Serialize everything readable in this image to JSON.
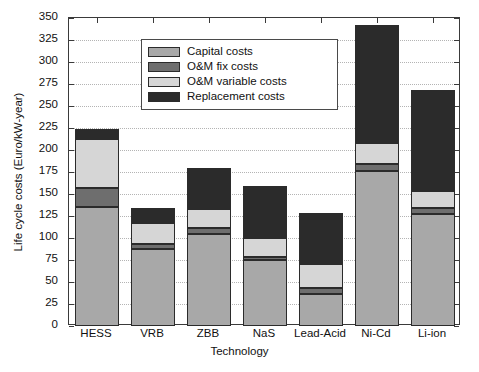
{
  "chart_data": {
    "type": "bar",
    "stacked": true,
    "title": "",
    "xlabel": "Technology",
    "ylabel": "Life cycle costs (Euro/kW-year)",
    "ylim": [
      0,
      350
    ],
    "ytick_step": 25,
    "yticks": [
      0,
      25,
      50,
      75,
      100,
      125,
      150,
      175,
      200,
      225,
      250,
      275,
      300,
      325,
      350
    ],
    "grid": true,
    "grid_axis": "y",
    "legend_position": "upper left",
    "categories": [
      "HESS",
      "VRB",
      "ZBB",
      "NaS",
      "Lead-Acid",
      "Ni-Cd",
      "Li-ion"
    ],
    "series": [
      {
        "name": "Capital costs",
        "color": "#a8a8a8",
        "values": [
          135,
          87,
          105,
          75,
          36,
          176,
          127
        ]
      },
      {
        "name": "O&M fix costs",
        "color": "#6e6e6e",
        "values": [
          22,
          6,
          6,
          3,
          7,
          8,
          7
        ]
      },
      {
        "name": "O&M variable costs",
        "color": "#d6d6d6",
        "values": [
          55,
          24,
          22,
          22,
          27,
          24,
          19
        ]
      },
      {
        "name": "Replacement costs",
        "color": "#2b2b2b",
        "values": [
          12,
          17,
          47,
          59,
          58,
          134,
          115
        ]
      }
    ],
    "totals": [
      224,
      134,
      180,
      159,
      128,
      342,
      268
    ]
  },
  "legend": {
    "items": [
      {
        "label": "Capital costs"
      },
      {
        "label": "O&M fix costs"
      },
      {
        "label": "O&M variable costs"
      },
      {
        "label": "Replacement costs"
      }
    ]
  }
}
